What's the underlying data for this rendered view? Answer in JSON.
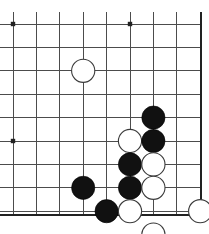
{
  "diagram": {
    "kind": "go-board-corner-diagram",
    "board": {
      "columns": 9,
      "rows": 9,
      "origin_x": 13,
      "origin_y": 24,
      "spacing": 23.4,
      "right_edge_x": 201,
      "bottom_edge_y": 215,
      "line_color": "#4c4c4c",
      "edge_color": "#222222",
      "background_color": "#ffffff",
      "stone_radius": 11.6
    },
    "star_points": [
      {
        "col": 0,
        "row": 0
      },
      {
        "col": 5,
        "row": 0
      },
      {
        "col": 0,
        "row": 5
      }
    ],
    "stones": [
      {
        "color": "white",
        "col": 3,
        "row": 2,
        "label": "white-stone-d3"
      },
      {
        "color": "black",
        "col": 6,
        "row": 4,
        "label": "black-stone-g5"
      },
      {
        "color": "white",
        "col": 5,
        "row": 5,
        "label": "white-stone-f6"
      },
      {
        "color": "black",
        "col": 6,
        "row": 5,
        "label": "black-stone-g6"
      },
      {
        "color": "black",
        "col": 5,
        "row": 6,
        "label": "black-stone-f7"
      },
      {
        "color": "white",
        "col": 6,
        "row": 6,
        "label": "white-stone-g7"
      },
      {
        "color": "black",
        "col": 5,
        "row": 7,
        "label": "black-stone-f8"
      },
      {
        "color": "white",
        "col": 6,
        "row": 7,
        "label": "white-stone-g8"
      },
      {
        "color": "black",
        "col": 3,
        "row": 7,
        "label": "black-stone-d8"
      },
      {
        "color": "black",
        "col": 4,
        "row": 8,
        "label": "black-stone-e9"
      },
      {
        "color": "white",
        "col": 5,
        "row": 8,
        "label": "white-stone-f9"
      },
      {
        "color": "white",
        "col": 8,
        "row": 8,
        "label": "white-stone-i9"
      },
      {
        "color": "white",
        "col": 6,
        "row": 9,
        "label": "white-stone-g10"
      }
    ],
    "colors": {
      "black_stone": "#111111",
      "white_stone": "#ffffff",
      "white_stone_outline": "#3a3a3a",
      "grid": "#4c4c4c",
      "edge": "#222222"
    }
  }
}
